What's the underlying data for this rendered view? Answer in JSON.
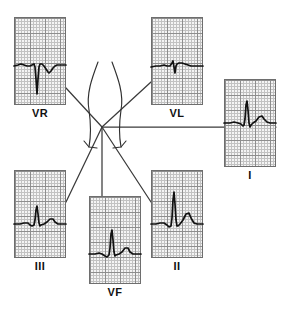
{
  "figure": {
    "type": "ecg-hexaxial-reference-diagram",
    "background_color": "#ffffff",
    "grid_minor_color": "#c2c2c2",
    "grid_major_color": "#8e8e8e",
    "grid_fill_color": "#f4f4f4",
    "trace_color": "#111111",
    "axis_line_color": "#3b3b3b"
  },
  "leads": [
    {
      "id": "aVR",
      "label": "VR",
      "position": {
        "left": 14,
        "top": 17,
        "width": 52,
        "height": 88
      },
      "label_top": 107,
      "baseline_ratio": 0.56,
      "morphology": "deep-negative-QS",
      "trace_points": "0,49 4,48 7,47 10,48 13,49 16,49 18,48 20,47 21,50 22,62 23,77 24,62 25,50 26,47 28,47 30,49 32,52 34,55 35,56 37,54 39,51 41,49 43,48 46,48 52,48"
    },
    {
      "id": "aVL",
      "label": "VL",
      "position": {
        "left": 151,
        "top": 17,
        "width": 52,
        "height": 88
      },
      "label_top": 107,
      "baseline_ratio": 0.56,
      "morphology": "small-biphasic-rS",
      "trace_points": "0,50 5,49 9,49 13,48 16,49 19,49 21,46 22,44 23,50 24,56 25,49 26,47 28,46 31,46 34,47 37,48 40,49 44,49 48,49 52,49"
    },
    {
      "id": "I",
      "label": "I",
      "position": {
        "left": 224,
        "top": 79,
        "width": 52,
        "height": 88
      },
      "label_top": 169,
      "baseline_ratio": 0.5,
      "morphology": "tall-R-with-T-wave",
      "trace_points": "0,44 6,44 10,43 14,44 17,45 19,47 20,46 21,40 22,26 23,22 24,31 25,44 26,48 27,46 29,44 32,42 35,38 38,37 40,40 43,43 46,44 49,44 52,44"
    },
    {
      "id": "III",
      "label": "III",
      "position": {
        "left": 14,
        "top": 170,
        "width": 52,
        "height": 88
      },
      "label_top": 260,
      "baseline_ratio": 0.61,
      "morphology": "moderate-R-with-T-wave",
      "trace_points": "0,54 6,54 10,53 14,53 16,55 18,56 20,55 21,50 22,40 23,36 24,44 25,53 26,56 27,55 30,54 33,52 36,49 39,49 41,52 44,54 47,54 52,54"
    },
    {
      "id": "aVF",
      "label": "VF",
      "position": {
        "left": 89,
        "top": 196,
        "width": 52,
        "height": 88
      },
      "label_top": 286,
      "baseline_ratio": 0.66,
      "morphology": "narrow-tall-R-with-T-wave",
      "trace_points": "0,58 6,58 10,57 13,58 16,60 18,61 20,59 21,52 22,38 23,34 24,44 25,56 26,60 27,59 30,58 33,56 36,52 39,52 41,56 44,58 47,58 52,58"
    },
    {
      "id": "II",
      "label": "II",
      "position": {
        "left": 151,
        "top": 170,
        "width": 52,
        "height": 88
      },
      "label_top": 260,
      "baseline_ratio": 0.61,
      "morphology": "tallest-R-with-prominent-T-wave",
      "trace_points": "0,54 5,54 9,53 13,53 16,55 18,57 20,56 21,48 22,30 23,22 24,34 25,50 26,56 27,56 29,54 32,50 35,44 38,43 40,48 43,53 46,54 52,54"
    }
  ],
  "axis_lines": [
    {
      "name": "axis-to-aVR",
      "x1": 102,
      "y1": 127,
      "x2": 66,
      "y2": 88
    },
    {
      "name": "axis-to-aVL",
      "x1": 102,
      "y1": 127,
      "x2": 151,
      "y2": 82
    },
    {
      "name": "axis-to-lead-I",
      "x1": 102,
      "y1": 127,
      "x2": 276,
      "y2": 127
    },
    {
      "name": "axis-to-lead-III",
      "x1": 102,
      "y1": 127,
      "x2": 66,
      "y2": 202
    },
    {
      "name": "axis-to-aVF",
      "x1": 102,
      "y1": 127,
      "x2": 102,
      "y2": 196
    },
    {
      "name": "axis-to-lead-II",
      "x1": 102,
      "y1": 127,
      "x2": 151,
      "y2": 202
    }
  ],
  "torso_arcs": [
    {
      "name": "torso-arc-left",
      "path": "M 98,62 C 92,78 86,94 89,110 C 91,124 91,136 89,147"
    },
    {
      "name": "torso-arc-right",
      "path": "M 112,62 C 118,78 124,94 121,110 C 119,124 119,136 121,147"
    }
  ],
  "arrowheads": [
    {
      "name": "arrowhead-left",
      "path": "M 89,147 L 84,141 M 89,147 L 97,148"
    },
    {
      "name": "arrowhead-right",
      "path": "M 121,147 L 126,141 M 121,147 L 113,148"
    }
  ]
}
